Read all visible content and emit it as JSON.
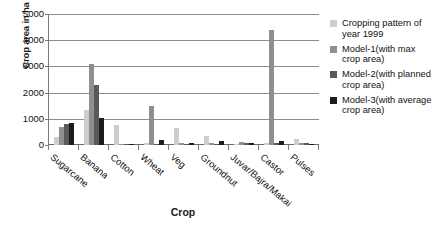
{
  "chart_data": {
    "type": "bar",
    "title": "",
    "xlabel": "Crop",
    "ylabel": "Crop area in ha",
    "ylim": [
      0,
      5000
    ],
    "yticks": [
      0,
      1000,
      2000,
      3000,
      4000,
      5000
    ],
    "ytick_labels": [
      "0",
      "1000",
      "2000",
      "3000",
      "4000",
      "5000"
    ],
    "grid": true,
    "legend_position": "right",
    "categories": [
      "Sugarcane",
      "Banana",
      "Cotton",
      "Wheat",
      "Veg",
      "Groundnut",
      "Juvar/Bajra/Makai",
      "Castor",
      "Pulses"
    ],
    "series": [
      {
        "name": "Cropping pattern of year 1999",
        "color": "#cdcdcd",
        "values": [
          310,
          1350,
          780,
          60,
          640,
          330,
          50,
          70,
          230
        ]
      },
      {
        "name": "Model-1(with max crop area)",
        "color": "#8f8f8f",
        "values": [
          700,
          3080,
          40,
          1500,
          60,
          60,
          120,
          4400,
          90
        ]
      },
      {
        "name": "Model-2(with planned crop area)",
        "color": "#595959",
        "values": [
          790,
          2280,
          30,
          40,
          40,
          40,
          90,
          60,
          70
        ]
      },
      {
        "name": "Model-3(with average crop area)",
        "color": "#1c1c1c",
        "values": [
          850,
          1050,
          30,
          180,
          60,
          140,
          70,
          160,
          40
        ]
      }
    ]
  },
  "legend": {
    "entries": [
      {
        "label": "Cropping pattern of year 1999",
        "color": "#cdcdcd"
      },
      {
        "label": "Model-1(with max crop area)",
        "color": "#8f8f8f"
      },
      {
        "label": "Model-2(with planned crop area)",
        "color": "#595959"
      },
      {
        "label": "Model-3(with average crop area)",
        "color": "#1c1c1c"
      }
    ]
  }
}
